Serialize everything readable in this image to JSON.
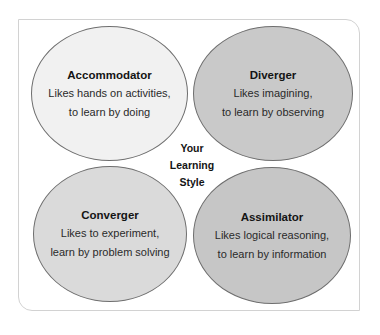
{
  "diagram": {
    "center": {
      "lines": [
        "Your",
        "Learning",
        "Style"
      ]
    },
    "styles": [
      {
        "name": "Accommodator",
        "line1": "Likes hands on activities,",
        "line2": "to learn by doing",
        "fill": "#f1f1f1",
        "position": "top-left"
      },
      {
        "name": "Diverger",
        "line1": "Likes imagining,",
        "line2": "to learn by observing",
        "fill": "#c9c9c9",
        "position": "top-right"
      },
      {
        "name": "Converger",
        "line1": "Likes to experiment,",
        "line2": "learn by problem solving",
        "fill": "#dadada",
        "position": "bottom-left"
      },
      {
        "name": "Assimilator",
        "line1": "Likes logical reasoning,",
        "line2": "to learn by information",
        "fill": "#c6c6c6",
        "position": "bottom-right"
      }
    ],
    "colors": {
      "frame_border": "#d2d2d2",
      "ellipse_border": "#6e6e6e",
      "text": "#1a1a1a"
    }
  }
}
